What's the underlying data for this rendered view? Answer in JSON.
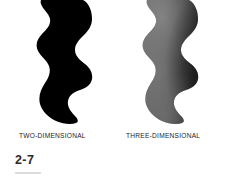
{
  "figure": {
    "number": "2-7",
    "panels": [
      {
        "id": "two-dimensional",
        "caption": "TWO-DIMENSIONAL",
        "render": "flat-silhouette",
        "fill": "#000000"
      },
      {
        "id": "three-dimensional",
        "caption": "THREE-DIMENSIONAL",
        "render": "shaded-volume",
        "fill_light": "#6f6f6f",
        "fill_mid": "#4a4a4a",
        "fill_dark": "#232323"
      }
    ],
    "colors": {
      "background": "#ffffff",
      "caption_text": "#1d1d1d",
      "figure_number_text": "#2b2b2b",
      "rule": "#dcdcdc"
    }
  }
}
